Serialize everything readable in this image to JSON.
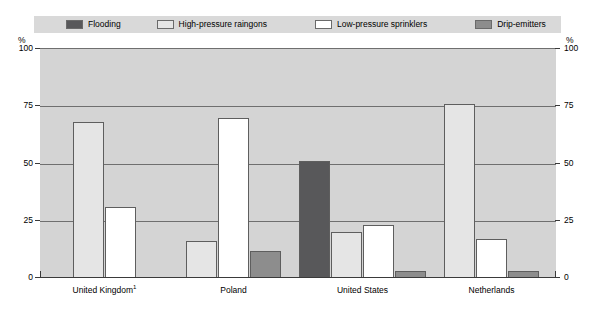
{
  "axis": {
    "unit_left": "%",
    "unit_right": "%",
    "ticks": [
      "100",
      "75",
      "50",
      "25",
      "0"
    ]
  },
  "legend": {
    "items": [
      {
        "label": "Flooding",
        "color": "#58585a",
        "key": "flooding"
      },
      {
        "label": "High-pressure raingons",
        "color": "#e5e5e5",
        "key": "raingun"
      },
      {
        "label": "Low-pressure sprinklers",
        "color": "#ffffff",
        "key": "sprinkler"
      },
      {
        "label": "Drip-emitters",
        "color": "#8d8d8d",
        "key": "drip"
      }
    ]
  },
  "chart_data": {
    "type": "bar",
    "title": "",
    "xlabel": "",
    "ylabel": "%",
    "ylim": [
      0,
      100
    ],
    "yticks": [
      0,
      25,
      50,
      75,
      100
    ],
    "grid": true,
    "legend_position": "top",
    "categories": [
      "United Kingdom¹",
      "Poland",
      "United States",
      "Netherlands"
    ],
    "series": [
      {
        "name": "Flooding",
        "color": "#58585a",
        "values": [
          null,
          null,
          51,
          null
        ]
      },
      {
        "name": "High-pressure raingons",
        "color": "#e5e5e5",
        "values": [
          68,
          16,
          20,
          76
        ]
      },
      {
        "name": "Low-pressure sprinklers",
        "color": "#ffffff",
        "values": [
          31,
          70,
          23,
          17
        ]
      },
      {
        "name": "Drip-emitters",
        "color": "#8d8d8d",
        "values": [
          null,
          12,
          3,
          3
        ]
      }
    ]
  }
}
